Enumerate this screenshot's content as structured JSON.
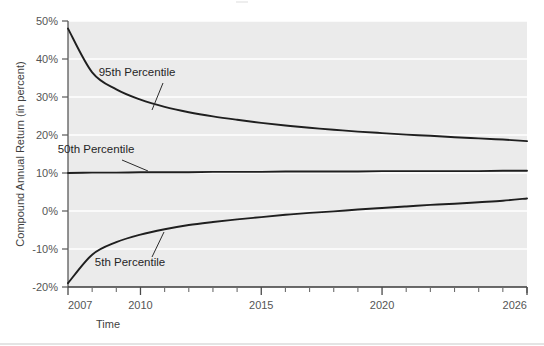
{
  "chart_data": {
    "type": "line",
    "title": "",
    "subtitle": "",
    "xlabel": "Time",
    "ylabel": "Compound Annual Return (in percent)",
    "xlim": [
      2007,
      2026
    ],
    "ylim": [
      -20,
      50
    ],
    "x_tick_labels": [
      "2007",
      "2010",
      "2015",
      "2020",
      "2026"
    ],
    "x_tick_values": [
      2007,
      2010,
      2015,
      2020,
      2026
    ],
    "x_minor_ticks": [
      2008,
      2009,
      2011,
      2012,
      2013,
      2014,
      2016,
      2017,
      2018,
      2019,
      2021,
      2022,
      2023,
      2024,
      2025
    ],
    "y_tick_labels": [
      "50%",
      "40%",
      "30%",
      "20%",
      "10%",
      "0%",
      "-10%",
      "-20%"
    ],
    "y_tick_values": [
      50,
      40,
      30,
      20,
      10,
      0,
      -10,
      -20
    ],
    "grid": "horizontal-white-on-grey",
    "legend": "none",
    "plot_bg": "#ebebeb",
    "grid_color": "#ffffff",
    "line_color": "#1f1f1f",
    "x": [
      2007,
      2008,
      2009,
      2010,
      2011,
      2012,
      2013,
      2014,
      2015,
      2016,
      2017,
      2018,
      2019,
      2020,
      2021,
      2022,
      2023,
      2024,
      2025,
      2026
    ],
    "series": [
      {
        "name": "95th Percentile",
        "annotation": "95th Percentile",
        "values": [
          48.0,
          36.5,
          32.0,
          29.3,
          27.4,
          26.0,
          24.9,
          24.0,
          23.2,
          22.5,
          21.9,
          21.4,
          20.9,
          20.5,
          20.1,
          19.8,
          19.4,
          19.1,
          18.8,
          18.4
        ]
      },
      {
        "name": "50th Percentile",
        "annotation": "50th Percentile",
        "values": [
          10.0,
          10.1,
          10.1,
          10.2,
          10.2,
          10.2,
          10.3,
          10.3,
          10.3,
          10.4,
          10.4,
          10.4,
          10.4,
          10.5,
          10.5,
          10.5,
          10.5,
          10.5,
          10.6,
          10.6
        ]
      },
      {
        "name": "5th Percentile",
        "annotation": "5th Percentile",
        "values": [
          -19.0,
          -11.5,
          -8.2,
          -6.2,
          -4.8,
          -3.7,
          -2.9,
          -2.2,
          -1.6,
          -1.0,
          -0.5,
          -0.1,
          0.4,
          0.8,
          1.2,
          1.6,
          1.9,
          2.3,
          2.7,
          3.3
        ]
      }
    ],
    "annotations": [
      {
        "text": "95th Percentile",
        "label_x": 137,
        "label_y": 76,
        "leader_from_x": 163,
        "leader_from_y": 83,
        "leader_to_x": 152,
        "leader_to_y": 110
      },
      {
        "text": "50th Percentile",
        "label_x": 96,
        "label_y": 153,
        "leader_from_x": 122,
        "leader_from_y": 160,
        "leader_to_x": 148,
        "leader_to_y": 171
      },
      {
        "text": "5th Percentile",
        "label_x": 130,
        "label_y": 266,
        "leader_from_x": 152,
        "leader_from_y": 257,
        "leader_to_x": 164,
        "leader_to_y": 232
      }
    ]
  }
}
